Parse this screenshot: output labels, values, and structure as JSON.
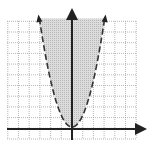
{
  "chart_data": {
    "type": "area",
    "title": "",
    "xlabel": "",
    "ylabel": "",
    "curve": {
      "equation": "y = x^2",
      "style": "dashed",
      "arrows": true,
      "vertex": [
        0,
        0
      ]
    },
    "shading": {
      "region": "inside/above parabola",
      "color": "#c8c8c8"
    },
    "x": [
      -3,
      -2,
      -1,
      0,
      1,
      2,
      3
    ],
    "values": [
      9,
      4,
      1,
      0,
      1,
      4,
      9
    ],
    "xlim": [
      -6,
      6
    ],
    "ylim": [
      -1,
      10
    ],
    "grid": true,
    "legend": "none"
  },
  "colors": {
    "grid": "#9a9a9a",
    "axis": "#222222",
    "curve": "#333333",
    "shade": "#c9c9c9"
  }
}
